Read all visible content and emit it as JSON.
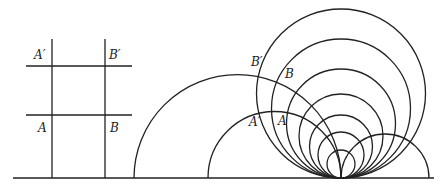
{
  "figure": {
    "left_grid": {
      "labels": {
        "a_prime": "A′",
        "b_prime": "B′",
        "a": "A",
        "b": "B"
      }
    },
    "right_circles": {
      "labels": {
        "b_prime": "B′",
        "b": "B",
        "a_prime": "A′",
        "a": "A"
      },
      "tangent_point": [
        341,
        178
      ],
      "circle_radii": [
        84.5,
        69.5,
        54.5,
        42,
        31.5,
        23,
        14
      ]
    }
  }
}
